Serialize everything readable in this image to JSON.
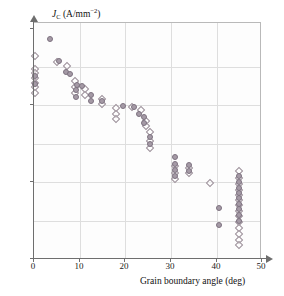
{
  "figure": {
    "name": "critical-current-density-vs-grain-boundary-angle"
  },
  "axes": {
    "y_title_symbol": "J",
    "y_title_sub": "C",
    "y_title_unit_open": " (A/mm",
    "y_title_unit_exp": "−2",
    "y_title_unit_close": ")",
    "x_title": "Grain boundary angle (deg)",
    "y_ticks": [
      {
        "label_base": "10",
        "label_exp": "8",
        "value": 100000000.0,
        "y_px": 28
      },
      {
        "label_base": "10",
        "label_exp": "6",
        "value": 1000000.0,
        "y_px": 104
      },
      {
        "label_base": "10",
        "label_exp": "4",
        "value": 10000.0,
        "y_px": 181
      },
      {
        "label_base": "10",
        "label_exp": "2",
        "value": 100.0,
        "y_px": 258
      }
    ],
    "x_ticks": [
      {
        "label": "0",
        "value": 0,
        "x_px": 33
      },
      {
        "label": "10",
        "value": 10,
        "x_px": 79
      },
      {
        "label": "20",
        "value": 20,
        "x_px": 124
      },
      {
        "label": "30",
        "value": 30,
        "x_px": 170
      },
      {
        "label": "40",
        "value": 40,
        "x_px": 216
      },
      {
        "label": "50",
        "value": 50,
        "x_px": 261
      }
    ],
    "grid_v_px": [
      79,
      124,
      170,
      216
    ],
    "grid_h_px": [
      66,
      104,
      143,
      181,
      220
    ]
  },
  "colors": {
    "diamond_stroke": "#9b8f99",
    "circle_fill": "#a59aa6",
    "circle_stroke": "#7d7280",
    "grid": "#dedede",
    "frame": "#b9b9b9",
    "axis": "#6e6e6e",
    "background": "#ffffff"
  },
  "chart_data": {
    "type": "scatter",
    "title": "",
    "xlabel": "Grain boundary angle (deg)",
    "ylabel": "J_C (A/mm^-2)",
    "xlim": [
      0,
      50
    ],
    "ylim": [
      100,
      100000000
    ],
    "yscale": "log",
    "grid": true,
    "legend": "none",
    "series": [
      {
        "name": "open-diamond",
        "marker": "diamond-open",
        "points": [
          [
            0.3,
            20000000.0
          ],
          [
            0.3,
            9000000.0
          ],
          [
            0.3,
            7000000.0
          ],
          [
            0.3,
            5200000.0
          ],
          [
            0.3,
            4000000.0
          ],
          [
            0.3,
            3000000.0
          ],
          [
            0.3,
            2200000.0
          ],
          [
            5.0,
            14000000.0
          ],
          [
            7.2,
            11000000.0
          ],
          [
            9.0,
            4500000.0
          ],
          [
            9.0,
            3000000.0
          ],
          [
            9.0,
            2100000.0
          ],
          [
            11.2,
            2700000.0
          ],
          [
            11.2,
            1900000.0
          ],
          [
            15.0,
            1500000.0
          ],
          [
            15.0,
            1100000.0
          ],
          [
            18.0,
            850000.0
          ],
          [
            18.0,
            600000.0
          ],
          [
            18.0,
            450000.0
          ],
          [
            21.5,
            900000.0
          ],
          [
            23.5,
            750000.0
          ],
          [
            24.5,
            400000.0
          ],
          [
            24.5,
            300000.0
          ],
          [
            25.5,
            200000.0
          ],
          [
            25.5,
            120000.0
          ],
          [
            25.5,
            80000.0
          ],
          [
            31.0,
            26000.0
          ],
          [
            31.0,
            18000.0
          ],
          [
            31.0,
            12000.0
          ],
          [
            34.0,
            24000.0
          ],
          [
            34.0,
            17000.0
          ],
          [
            38.5,
            9500.0
          ],
          [
            45.0,
            20000.0
          ],
          [
            45.0,
            13000.0
          ],
          [
            45.0,
            9000.0
          ],
          [
            45.0,
            6500.0
          ],
          [
            45.0,
            4800.0
          ],
          [
            45.0,
            3400.0
          ],
          [
            45.0,
            2500.0
          ],
          [
            45.0,
            1800.0
          ],
          [
            45.0,
            1300.0
          ],
          [
            45.0,
            900.0
          ],
          [
            45.0,
            650.0
          ],
          [
            45.0,
            450.0
          ],
          [
            45.0,
            320.0
          ],
          [
            45.0,
            230.0
          ]
        ]
      },
      {
        "name": "filled-circle",
        "marker": "circle-filled",
        "points": [
          [
            0.3,
            6000000.0
          ],
          [
            0.3,
            3600000.0
          ],
          [
            3.5,
            55000000.0
          ],
          [
            5.5,
            15000000.0
          ],
          [
            7.0,
            7500000.0
          ],
          [
            7.8,
            6800000.0
          ],
          [
            9.5,
            3400000.0
          ],
          [
            10.5,
            3300000.0
          ],
          [
            9.2,
            2500000.0
          ],
          [
            9.2,
            1700000.0
          ],
          [
            12.5,
            1900000.0
          ],
          [
            12.5,
            1300000.0
          ],
          [
            15.0,
            1300000.0
          ],
          [
            19.5,
            1000000.0
          ],
          [
            22.0,
            900000.0
          ],
          [
            23.0,
            600000.0
          ],
          [
            24.2,
            500000.0
          ],
          [
            24.2,
            360000.0
          ],
          [
            25.5,
            150000.0
          ],
          [
            25.5,
            100000.0
          ],
          [
            31.0,
            45000.0
          ],
          [
            31.0,
            30000.0
          ],
          [
            31.0,
            21000.0
          ],
          [
            31.0,
            15000.0
          ],
          [
            34.0,
            28000.0
          ],
          [
            34.0,
            20000.0
          ],
          [
            40.5,
            2200.0
          ],
          [
            40.5,
            750.0
          ],
          [
            45.0,
            15000.0
          ],
          [
            45.0,
            10000.0
          ],
          [
            45.0,
            7000.0
          ],
          [
            45.0,
            5200.0
          ],
          [
            45.0,
            3800.0
          ],
          [
            45.0,
            2700.0
          ],
          [
            45.0,
            2000.0
          ],
          [
            45.0,
            1400.0
          ],
          [
            45.0,
            1000.0
          ]
        ]
      }
    ]
  }
}
